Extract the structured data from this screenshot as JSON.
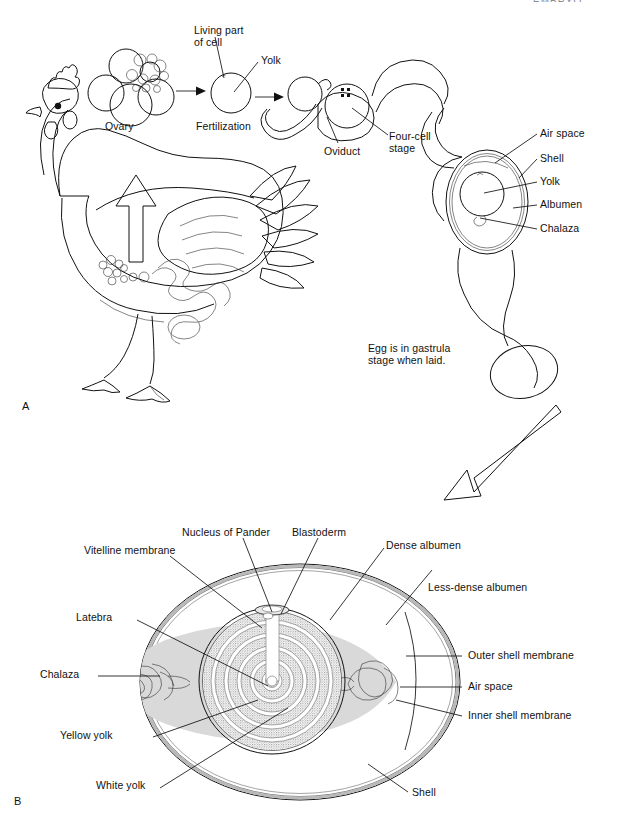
{
  "figure": {
    "cut_header_text": "EMBRYO",
    "panels": [
      {
        "letter": "A",
        "name": "panel-a-egg-formation"
      },
      {
        "letter": "B",
        "name": "panel-b-egg-structure"
      }
    ]
  },
  "panel_a": {
    "labels": {
      "living_part_of_cell": "Living part\nof cell",
      "yolk": "Yolk",
      "ovary": "Ovary",
      "fertilization": "Fertilization",
      "oviduct": "Oviduct",
      "four_cell_stage": "Four-cell\nstage",
      "air_space": "Air space",
      "shell": "Shell",
      "yolk_right": "Yolk",
      "albumen": "Albumen",
      "chalaza": "Chalaza"
    },
    "note": "Egg is in gastrula\nstage when laid."
  },
  "panel_b": {
    "labels": {
      "vitelline_membrane": "Vitelline membrane",
      "nucleus_of_pander": "Nucleus of Pander",
      "blastoderm": "Blastoderm",
      "dense_albumen": "Dense albumen",
      "less_dense_albumen": "Less-dense albumen",
      "latebra": "Latebra",
      "chalaza": "Chalaza",
      "yellow_yolk": "Yellow yolk",
      "white_yolk": "White yolk",
      "outer_shell_membrane": "Outer shell membrane",
      "air_space": "Air space",
      "inner_shell_membrane": "Inner shell membrane",
      "shell": "Shell"
    }
  },
  "colors": {
    "ink": "#111111",
    "stipple": "#9a9a9a",
    "albumen_shade": "#d8d8d8",
    "paper": "#ffffff"
  }
}
